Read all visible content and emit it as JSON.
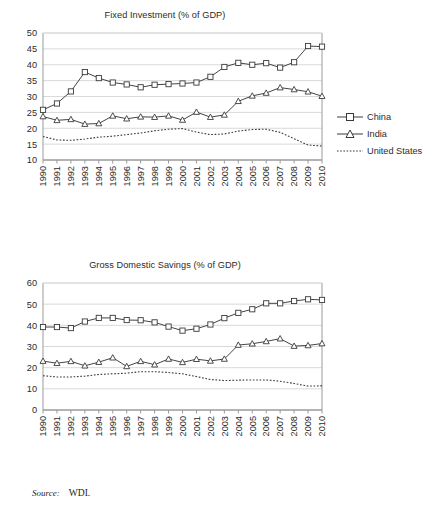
{
  "source": {
    "label": "Source:",
    "value": "WDI."
  },
  "colors": {
    "axis": "#9a9a9a",
    "grid": "#d9d9d9",
    "series_line": "#3a3a3a",
    "text": "#2b2b2b",
    "background": "#ffffff"
  },
  "legend": {
    "china": "China",
    "india": "India",
    "united_states": "United States"
  },
  "chart_data": [
    {
      "id": "fixed-investment",
      "type": "line",
      "title": "Fixed Investment (% of GDP)",
      "xlabel": "",
      "ylabel": "",
      "ylim": [
        10,
        50
      ],
      "ytick_step": 5,
      "yticks": [
        10,
        15,
        20,
        25,
        30,
        35,
        40,
        45,
        50
      ],
      "grid": true,
      "legend_position": "right",
      "categories": [
        1990,
        1991,
        1992,
        1993,
        1994,
        1995,
        1996,
        1997,
        1998,
        1999,
        2000,
        2001,
        2002,
        2003,
        2004,
        2005,
        2006,
        2007,
        2008,
        2009,
        2010
      ],
      "series": [
        {
          "name": "China",
          "marker": "square",
          "style": "solid",
          "values": [
            25.8,
            27.8,
            31.6,
            37.7,
            35.8,
            34.4,
            33.8,
            32.9,
            33.7,
            33.9,
            34.1,
            34.4,
            36.2,
            39.3,
            40.6,
            40.0,
            40.5,
            39.1,
            40.8,
            45.9,
            45.7
          ]
        },
        {
          "name": "India",
          "marker": "triangle",
          "style": "solid",
          "values": [
            23.7,
            22.5,
            22.8,
            21.3,
            21.5,
            23.9,
            23.0,
            23.6,
            23.5,
            23.9,
            22.6,
            25.1,
            23.5,
            24.2,
            28.5,
            30.2,
            31.1,
            32.8,
            32.2,
            31.5,
            30.1
          ]
        },
        {
          "name": "United States",
          "marker": "none",
          "style": "dotted",
          "values": [
            17.4,
            16.3,
            16.2,
            16.6,
            17.2,
            17.5,
            18.0,
            18.5,
            19.2,
            19.7,
            19.9,
            18.8,
            18.0,
            18.2,
            19.1,
            19.6,
            19.7,
            18.7,
            16.7,
            14.7,
            14.4
          ]
        }
      ]
    },
    {
      "id": "gross-domestic-savings",
      "type": "line",
      "title": "Gross Domestic Savings (% of GDP)",
      "xlabel": "",
      "ylabel": "",
      "ylim": [
        0,
        60
      ],
      "ytick_step": 10,
      "yticks": [
        0,
        10,
        20,
        30,
        40,
        50,
        60
      ],
      "grid": true,
      "legend_position": "right",
      "categories": [
        1990,
        1991,
        1992,
        1993,
        1994,
        1995,
        1996,
        1997,
        1998,
        1999,
        2000,
        2001,
        2002,
        2003,
        2004,
        2005,
        2006,
        2007,
        2008,
        2009,
        2010
      ],
      "series": [
        {
          "name": "China",
          "marker": "square",
          "style": "solid",
          "values": [
            39.2,
            39.2,
            38.7,
            41.8,
            43.5,
            43.5,
            42.5,
            42.4,
            41.4,
            39.4,
            37.5,
            38.4,
            40.4,
            43.4,
            45.9,
            47.6,
            50.4,
            50.4,
            51.5,
            52.3,
            52.0
          ]
        },
        {
          "name": "India",
          "marker": "triangle",
          "style": "solid",
          "values": [
            23.1,
            22.1,
            23.0,
            20.9,
            22.6,
            24.7,
            20.6,
            23.0,
            21.4,
            24.1,
            22.5,
            24.0,
            23.2,
            24.1,
            30.7,
            31.3,
            32.4,
            33.7,
            30.2,
            30.5,
            31.4
          ]
        },
        {
          "name": "United States",
          "marker": "none",
          "style": "dotted",
          "values": [
            16.2,
            15.6,
            15.6,
            16.0,
            16.8,
            17.1,
            17.4,
            18.1,
            18.1,
            17.7,
            17.1,
            15.8,
            14.4,
            13.9,
            14.1,
            14.2,
            14.2,
            13.6,
            12.5,
            11.3,
            11.4
          ]
        }
      ]
    }
  ]
}
